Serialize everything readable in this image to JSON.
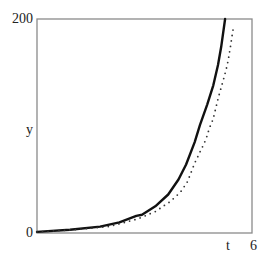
{
  "chart_data": {
    "type": "line",
    "title": "",
    "xlabel": "t",
    "ylabel": "y",
    "xlim": [
      0,
      6
    ],
    "ylim": [
      0,
      200
    ],
    "x_tick_labels": [
      "6"
    ],
    "y_tick_labels": [
      "0",
      "200"
    ],
    "grid": false,
    "legend": null,
    "series": [
      {
        "name": "solution",
        "style": "solid",
        "color": "#111111",
        "x": [
          0,
          0.92,
          1.76,
          2.3,
          2.77,
          2.93,
          3.3,
          3.66,
          3.95,
          4.16,
          4.4,
          4.55,
          4.75,
          4.92,
          5.05,
          5.14,
          5.25
        ],
        "y": [
          1,
          3,
          6,
          10,
          16,
          17,
          25,
          36,
          50,
          64,
          85,
          101,
          120,
          138,
          157,
          174,
          200
        ]
      },
      {
        "name": "approximation",
        "style": "dotted",
        "color": "#333333",
        "x": [
          0,
          1.0,
          2.0,
          2.8,
          3.3,
          3.7,
          4.0,
          4.2,
          4.41,
          4.61,
          4.72,
          4.8,
          4.92,
          5.0,
          5.08,
          5.2,
          5.31,
          5.39,
          5.47
        ],
        "y": [
          1,
          3,
          6,
          13,
          20,
          29,
          38,
          48,
          66,
          80,
          88,
          97,
          107,
          118,
          129,
          143,
          157,
          172,
          190
        ]
      }
    ]
  },
  "labels": {
    "y_top": "200",
    "y_bottom": "0",
    "y_axis": "y",
    "x_axis": "t",
    "x_right": "6"
  },
  "colors": {
    "frame": "#8a8a8a",
    "curve": "#111111",
    "dots": "#333333"
  }
}
